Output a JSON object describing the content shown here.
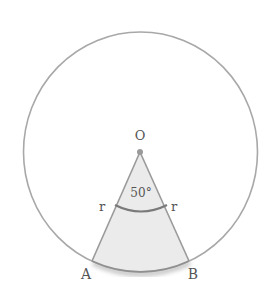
{
  "diagram": {
    "type": "circle-sector",
    "center_label": "O",
    "angle_label": "50°",
    "radius_labels": [
      "r",
      "r"
    ],
    "point_labels": {
      "left": "A",
      "right": "B"
    },
    "angle_degrees": 50,
    "colors": {
      "circle_stroke": "#a8a8a8",
      "sector_fill": "#ebebeb",
      "sector_stroke": "#9a9a9a",
      "angle_arc": "#7a7a7a",
      "arc_shadow": "#b5b5b5",
      "text": "#555555"
    }
  }
}
